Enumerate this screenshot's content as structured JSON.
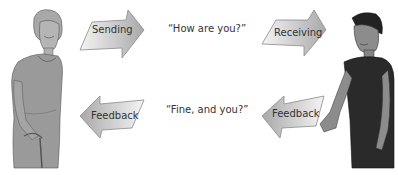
{
  "diagram": {
    "title": "",
    "sender": {
      "label": "",
      "role": "sender"
    },
    "receiver": {
      "label": "",
      "role": "receiver"
    },
    "arrows": [
      {
        "id": "sending",
        "label": "Sending",
        "direction": "right",
        "position": "top-left"
      },
      {
        "id": "receiving",
        "label": "Receiving",
        "direction": "right",
        "position": "top-right"
      },
      {
        "id": "feedback-left",
        "label": "Feedback",
        "direction": "left",
        "position": "bottom-left"
      },
      {
        "id": "feedback-right",
        "label": "Feedback",
        "direction": "left",
        "position": "bottom-right"
      }
    ],
    "messages": {
      "top": "“How are you?”",
      "bottom": "“Fine, and you?”"
    }
  },
  "colors": {
    "background": "#ffffff",
    "arrow_light": "#f4f4f4",
    "arrow_dark": "#a9a9a9",
    "arrow_stroke": "#8a8a8a",
    "woman_fill": "#9a9a9a",
    "man_shirt": "#2a2a2a",
    "man_skin": "#8c8c8c",
    "text": "#333333"
  }
}
